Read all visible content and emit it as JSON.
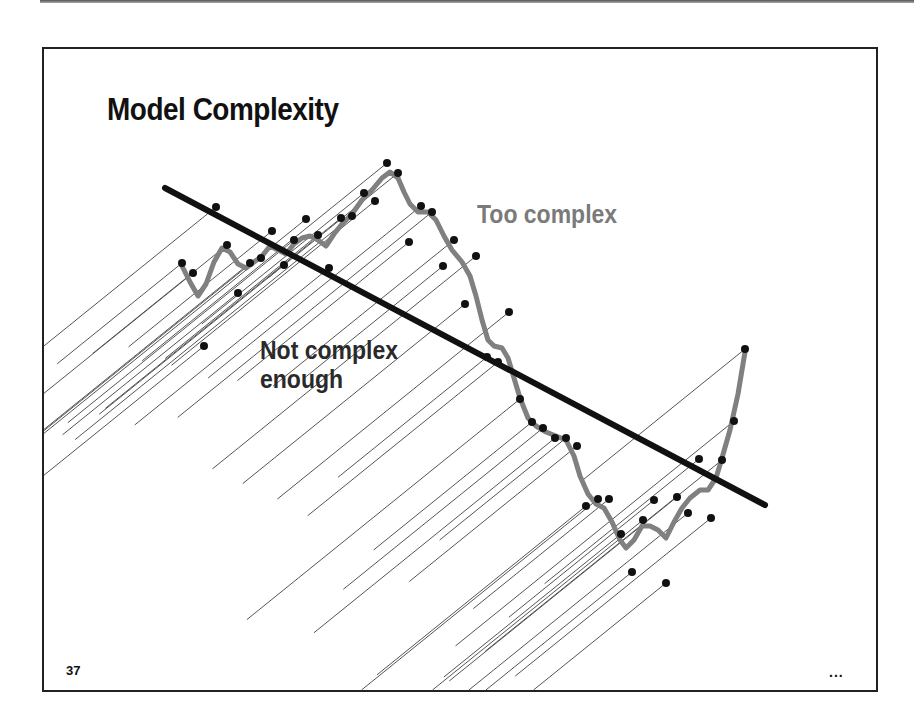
{
  "slide": {
    "title": "Model Complexity",
    "page_number": "37",
    "ellipsis": "...",
    "labels": {
      "too_complex": "Too complex",
      "not_complex_line1": "Not complex",
      "not_complex_line2": "enough"
    }
  },
  "colors": {
    "regression_line": "#111111",
    "overfit_curve": "#808080",
    "too_complex_label": "#7a7a7a",
    "dots": "#111111",
    "residual_lines": "#555555"
  },
  "chart_data": {
    "type": "scatter",
    "title": "Model Complexity",
    "points_px": [
      [
        182,
        263
      ],
      [
        193,
        273
      ],
      [
        204,
        346
      ],
      [
        216,
        207
      ],
      [
        227,
        245
      ],
      [
        238,
        293
      ],
      [
        250,
        263
      ],
      [
        261,
        258
      ],
      [
        272,
        231
      ],
      [
        284,
        265
      ],
      [
        294,
        240
      ],
      [
        306,
        219
      ],
      [
        318,
        235
      ],
      [
        329,
        268
      ],
      [
        341,
        218
      ],
      [
        352,
        216
      ],
      [
        364,
        193
      ],
      [
        375,
        201
      ],
      [
        387,
        163
      ],
      [
        398,
        173
      ],
      [
        409,
        242
      ],
      [
        421,
        206
      ],
      [
        432,
        212
      ],
      [
        443,
        266
      ],
      [
        454,
        240
      ],
      [
        465,
        304
      ],
      [
        476,
        256
      ],
      [
        487,
        357
      ],
      [
        498,
        362
      ],
      [
        509,
        312
      ],
      [
        520,
        399
      ],
      [
        532,
        422
      ],
      [
        543,
        428
      ],
      [
        555,
        438
      ],
      [
        566,
        438
      ],
      [
        577,
        446
      ],
      [
        586,
        506
      ],
      [
        598,
        499
      ],
      [
        609,
        499
      ],
      [
        621,
        534
      ],
      [
        632,
        572
      ],
      [
        643,
        520
      ],
      [
        654,
        500
      ],
      [
        666,
        583
      ],
      [
        677,
        497
      ],
      [
        688,
        513
      ],
      [
        699,
        459
      ],
      [
        711,
        518
      ],
      [
        722,
        460
      ],
      [
        734,
        421
      ],
      [
        745,
        349
      ]
    ],
    "underfit_line_px": [
      [
        165,
        188
      ],
      [
        765,
        505
      ]
    ],
    "overfit_curve_px": [
      [
        182,
        266
      ],
      [
        190,
        282
      ],
      [
        198,
        296
      ],
      [
        206,
        284
      ],
      [
        214,
        262
      ],
      [
        222,
        248
      ],
      [
        230,
        252
      ],
      [
        238,
        264
      ],
      [
        246,
        268
      ],
      [
        254,
        262
      ],
      [
        262,
        256
      ],
      [
        270,
        246
      ],
      [
        278,
        250
      ],
      [
        286,
        254
      ],
      [
        294,
        244
      ],
      [
        302,
        238
      ],
      [
        310,
        236
      ],
      [
        318,
        240
      ],
      [
        326,
        246
      ],
      [
        334,
        234
      ],
      [
        342,
        224
      ],
      [
        352,
        214
      ],
      [
        362,
        200
      ],
      [
        372,
        190
      ],
      [
        382,
        178
      ],
      [
        390,
        172
      ],
      [
        398,
        178
      ],
      [
        404,
        192
      ],
      [
        410,
        204
      ],
      [
        418,
        212
      ],
      [
        428,
        212
      ],
      [
        436,
        220
      ],
      [
        444,
        236
      ],
      [
        452,
        250
      ],
      [
        462,
        262
      ],
      [
        470,
        276
      ],
      [
        476,
        296
      ],
      [
        482,
        320
      ],
      [
        488,
        340
      ],
      [
        494,
        346
      ],
      [
        502,
        348
      ],
      [
        508,
        358
      ],
      [
        514,
        378
      ],
      [
        520,
        398
      ],
      [
        528,
        418
      ],
      [
        536,
        426
      ],
      [
        546,
        432
      ],
      [
        556,
        436
      ],
      [
        566,
        440
      ],
      [
        574,
        456
      ],
      [
        580,
        476
      ],
      [
        588,
        494
      ],
      [
        596,
        504
      ],
      [
        604,
        508
      ],
      [
        612,
        522
      ],
      [
        620,
        540
      ],
      [
        626,
        548
      ],
      [
        634,
        540
      ],
      [
        642,
        526
      ],
      [
        650,
        526
      ],
      [
        658,
        530
      ],
      [
        666,
        538
      ],
      [
        674,
        522
      ],
      [
        682,
        508
      ],
      [
        690,
        498
      ],
      [
        700,
        490
      ],
      [
        708,
        490
      ],
      [
        716,
        478
      ],
      [
        722,
        458
      ],
      [
        730,
        430
      ],
      [
        738,
        394
      ],
      [
        745,
        352
      ]
    ],
    "xlabel": "",
    "ylabel": "",
    "grid": false,
    "legend": "none (inline labels)"
  }
}
